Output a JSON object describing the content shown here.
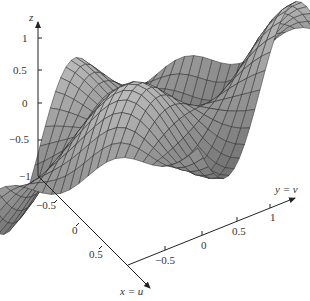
{
  "chart_data": {
    "type": "surface3d",
    "title": "",
    "function_hint": "wavy saddle-like surface z = f(u,v) over u,v in [-1,1]",
    "axes": {
      "x": {
        "label": "x = u",
        "ticks": [
          "-0.5",
          "0",
          "0.5"
        ],
        "range": [
          -1,
          1
        ]
      },
      "y": {
        "label": "y = v",
        "ticks": [
          "-0.5",
          "0",
          "0.5",
          "1"
        ],
        "range": [
          -1,
          1
        ]
      },
      "z": {
        "label": "z",
        "ticks": [
          "1",
          "0.5",
          "0",
          "-0.5",
          "-1"
        ],
        "range": [
          -1,
          1.2
        ]
      }
    },
    "mesh": {
      "rows": 24,
      "cols": 24,
      "style": "grey shaded with dark grid lines"
    },
    "grid": false,
    "legend": null
  },
  "labels": {
    "z_axis": "z",
    "x_axis": "x = u",
    "y_axis": "y = v",
    "z_ticks": [
      "1",
      "0.5",
      "0",
      "−0.5",
      "−1"
    ],
    "x_ticks": [
      "−0.5",
      "0",
      "0.5"
    ],
    "y_ticks": [
      "−0.5",
      "0",
      "0.5",
      "1"
    ]
  },
  "colors": {
    "axis": "#222222",
    "mesh_line": "#2a2a2a",
    "surface_light": "#c8c8c8",
    "surface_dark": "#6a6a6a"
  }
}
